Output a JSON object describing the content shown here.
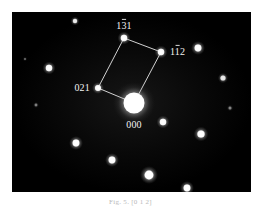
{
  "figure": {
    "kind": "electron-diffraction-pattern",
    "caption": "Fig. 5. [0 1 2]",
    "panel": {
      "background_color": "#010101",
      "border_color": "#ffffff",
      "x": 12,
      "y": 12,
      "width": 239,
      "height": 180
    },
    "line_color": "#e8e8e8",
    "label_color": "#f2f2f2"
  },
  "chart_data": {
    "type": "scatter",
    "xlabel": "",
    "ylabel": "",
    "xlim": [
      0,
      239
    ],
    "ylim": [
      0,
      180
    ],
    "grid": false,
    "legend": null,
    "note": "Reciprocal-lattice spots; panel-local pixel coordinates, y down.",
    "spots": [
      {
        "id": "000",
        "x": 122,
        "y": 91,
        "r": 10.5,
        "halo": 21,
        "bright": 1.0,
        "indexed": true
      },
      {
        "id": "131",
        "x": 112,
        "y": 26,
        "r": 3.2,
        "halo": 6.5,
        "bright": 0.92,
        "indexed": true
      },
      {
        "id": "112",
        "x": 149,
        "y": 40,
        "r": 3.2,
        "halo": 6.5,
        "bright": 0.92,
        "indexed": true
      },
      {
        "id": "021",
        "x": 86,
        "y": 76,
        "r": 3.0,
        "halo": 6.0,
        "bright": 0.9,
        "indexed": true
      },
      {
        "id": "s1",
        "x": 63,
        "y": 9,
        "r": 2.2,
        "halo": 4.5,
        "bright": 0.75,
        "indexed": false
      },
      {
        "id": "s2",
        "x": 37,
        "y": 56,
        "r": 3.2,
        "halo": 6.5,
        "bright": 0.92,
        "indexed": false
      },
      {
        "id": "s3",
        "x": 186,
        "y": 36,
        "r": 3.4,
        "halo": 7.0,
        "bright": 0.94,
        "indexed": false
      },
      {
        "id": "s4",
        "x": 211,
        "y": 66,
        "r": 2.6,
        "halo": 5.2,
        "bright": 0.72,
        "indexed": false
      },
      {
        "id": "s5",
        "x": 151,
        "y": 110,
        "r": 3.2,
        "halo": 6.5,
        "bright": 0.92,
        "indexed": false
      },
      {
        "id": "s6",
        "x": 189,
        "y": 122,
        "r": 3.6,
        "halo": 7.4,
        "bright": 0.95,
        "indexed": false
      },
      {
        "id": "s7",
        "x": 64,
        "y": 131,
        "r": 3.4,
        "halo": 7.0,
        "bright": 0.94,
        "indexed": false
      },
      {
        "id": "s8",
        "x": 100,
        "y": 148,
        "r": 3.4,
        "halo": 7.0,
        "bright": 0.94,
        "indexed": false
      },
      {
        "id": "s9",
        "x": 137,
        "y": 163,
        "r": 4.4,
        "halo": 9.0,
        "bright": 0.98,
        "indexed": false
      },
      {
        "id": "s10",
        "x": 175,
        "y": 176,
        "r": 3.4,
        "halo": 7.0,
        "bright": 0.94,
        "indexed": false
      },
      {
        "id": "s11",
        "x": 24,
        "y": 93,
        "r": 1.4,
        "halo": 3.0,
        "bright": 0.3,
        "indexed": false
      },
      {
        "id": "s12",
        "x": 218,
        "y": 96,
        "r": 1.5,
        "halo": 3.2,
        "bright": 0.32,
        "indexed": false
      },
      {
        "id": "s13",
        "x": 13,
        "y": 47,
        "r": 1.1,
        "halo": 2.4,
        "bright": 0.22,
        "indexed": false
      }
    ],
    "net_polygon": [
      "131",
      "112",
      "000",
      "021",
      "131"
    ],
    "labels": [
      {
        "id": "131",
        "digits": "131",
        "overbar_on": [
          2
        ],
        "x": 112,
        "y": 17,
        "anchor": "middle"
      },
      {
        "id": "112",
        "digits": "112",
        "overbar_on": [
          2
        ],
        "x": 158,
        "y": 43,
        "anchor": "start"
      },
      {
        "id": "021",
        "digits": "021",
        "overbar_on": [],
        "x": 78,
        "y": 79,
        "anchor": "end"
      },
      {
        "id": "000",
        "digits": "000",
        "overbar_on": [],
        "x": 122,
        "y": 116,
        "anchor": "middle"
      }
    ]
  }
}
